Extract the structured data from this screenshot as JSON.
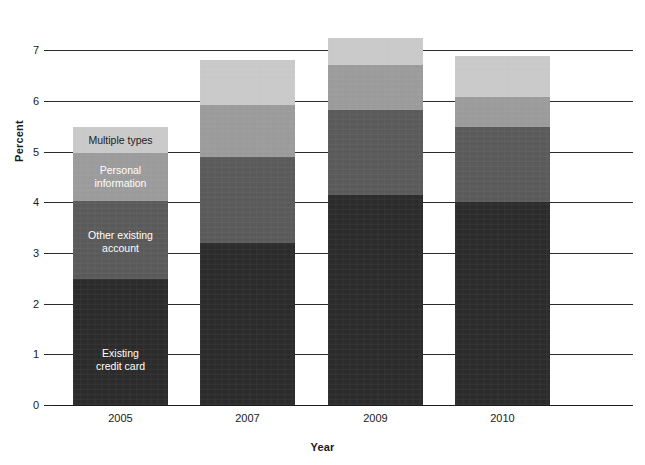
{
  "chart_data": {
    "type": "bar",
    "subtype": "stacked-bar",
    "title": "",
    "xlabel": "Year",
    "ylabel": "Percent",
    "categories": [
      "2005",
      "2007",
      "2009",
      "2010"
    ],
    "ylim": [
      0,
      7.4
    ],
    "yticks": [
      0,
      1,
      2,
      3,
      4,
      5,
      6,
      7
    ],
    "ytick_labels": [
      "0",
      "1",
      "2",
      "3",
      "4",
      "5",
      "6",
      "7"
    ],
    "grid": "horizontal",
    "legend": "in-bar labels on first bar (2005)",
    "series": [
      {
        "name": "Existing\ncredit card",
        "label_text": "Existing\ncredit card",
        "color": "#2b2b2b",
        "label_color": "#ffffff",
        "values": [
          2.49,
          3.2,
          4.14,
          4.0
        ]
      },
      {
        "name": "Other existing\naccount",
        "label_text": "Other existing\naccount",
        "color": "#5a5a5a",
        "label_color": "#ffffff",
        "values": [
          1.53,
          1.69,
          1.69,
          1.48
        ]
      },
      {
        "name": "Personal\ninformation",
        "label_text": "Personal\ninformation",
        "color": "#9b9b9b",
        "label_color": "#ffffff",
        "values": [
          0.95,
          1.03,
          0.87,
          0.6
        ]
      },
      {
        "name": "Multiple types",
        "label_text": "Multiple types",
        "color": "#c9c9c9",
        "label_color": "#1a1a1a",
        "values": [
          0.51,
          0.88,
          0.54,
          0.81
        ]
      }
    ],
    "totals": [
      5.48,
      6.8,
      7.24,
      6.89
    ]
  },
  "axes": {
    "y_title": "Percent",
    "x_title": "Year"
  },
  "colors": {
    "existing_credit_card": "#2b2b2b",
    "other_existing_account": "#5a5a5a",
    "personal_information": "#9b9b9b",
    "multiple_types": "#c9c9c9",
    "axis": "#2b2b2b",
    "background": "#ffffff"
  }
}
